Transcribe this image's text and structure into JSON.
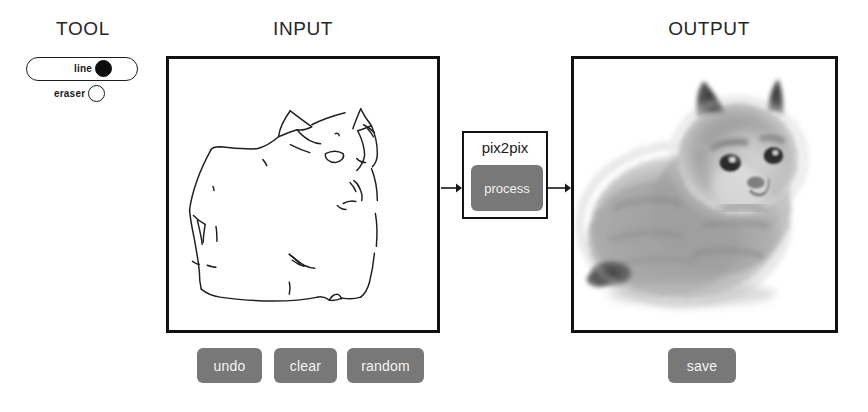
{
  "app": {
    "name": "pix2pix edges2cats interactive demo"
  },
  "sections": {
    "tool": {
      "title": "TOOL"
    },
    "input": {
      "title": "INPUT"
    },
    "output": {
      "title": "OUTPUT"
    }
  },
  "tool_selector": {
    "options": [
      {
        "id": "line",
        "label": "line",
        "selected": true
      },
      {
        "id": "eraser",
        "label": "eraser",
        "selected": false
      }
    ],
    "selected": "line"
  },
  "input_canvas": {
    "description": "hand-drawn black outline sketch of a seated cat on white background",
    "stroke_color": "#1a1a1a",
    "background": "#ffffff"
  },
  "output_canvas": {
    "description": "generated grayscale photo of a fluffy long-haired cat sitting, facing right",
    "background": "#ffffff"
  },
  "model": {
    "label": "pix2pix",
    "process_label": "process"
  },
  "flow": {
    "arrow_in": "arrow-right",
    "arrow_out": "arrow-right"
  },
  "actions": {
    "undo_label": "undo",
    "clear_label": "clear",
    "random_label": "random",
    "save_label": "save"
  },
  "colors": {
    "button_gray": "#787878",
    "button_text": "#f4f4f4",
    "panel_border": "#111111",
    "ink": "#1a1a1a",
    "canvas_bg": "#ffffff"
  }
}
